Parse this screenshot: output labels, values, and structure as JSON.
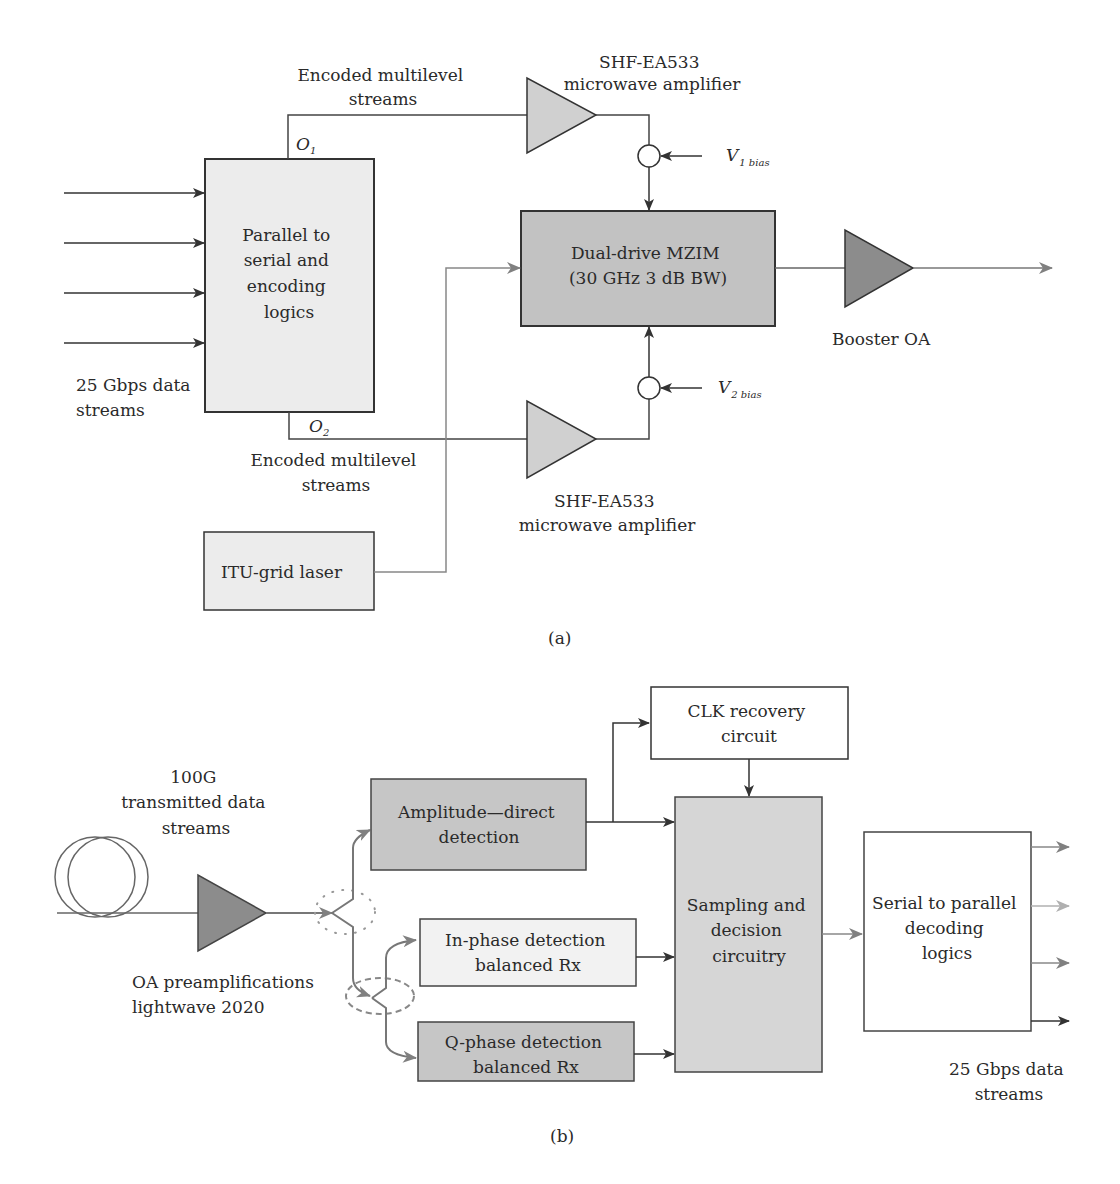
{
  "panel_a": {
    "caption": "(a)",
    "input_label": [
      "25 Gbps data",
      "streams"
    ],
    "p2s_box": [
      "Parallel to",
      "serial and",
      "encoding",
      "logics"
    ],
    "o1": "O",
    "o1_sub": "1",
    "o2": "O",
    "o2_sub": "2",
    "top_stream_label": [
      "Encoded multilevel",
      "streams"
    ],
    "bottom_stream_label": [
      "Encoded multilevel",
      "streams"
    ],
    "top_amp_label": [
      "SHF-EA533",
      "microwave amplifier"
    ],
    "bottom_amp_label": [
      "SHF-EA533",
      "microwave amplifier"
    ],
    "v1": "V",
    "v1_sub": "1 bias",
    "v2": "V",
    "v2_sub": "2 bias",
    "mzim_box": [
      "Dual-drive MZIM",
      "(30 GHz 3 dB BW)"
    ],
    "booster_label": "Booster OA",
    "laser_box": "ITU-grid laser"
  },
  "panel_b": {
    "caption": "(b)",
    "fiber_label": [
      "100G",
      "transmitted data",
      "streams"
    ],
    "preamp_label": [
      "OA preamplifications",
      "lightwave 2020"
    ],
    "amp_det_box": [
      "Amplitude—direct",
      "detection"
    ],
    "clk_box": [
      "CLK recovery",
      "circuit"
    ],
    "inphase_box": [
      "In-phase detection",
      "balanced Rx"
    ],
    "qphase_box": [
      "Q-phase detection",
      "balanced Rx"
    ],
    "sampling_box": [
      "Sampling and",
      "decision",
      "circuitry"
    ],
    "s2p_box": [
      "Serial to parallel",
      "decoding",
      "logics"
    ],
    "output_label": [
      "25 Gbps data",
      "streams"
    ]
  },
  "colors": {
    "light_fill": "#e8e8e8",
    "mid_fill": "#c4c4c4",
    "dark_fill": "#8a8a8a",
    "line_dark": "#333333",
    "line_gray": "#7a7a7a"
  }
}
